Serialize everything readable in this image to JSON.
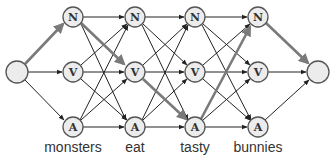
{
  "diagram": {
    "start_node": {
      "label": ""
    },
    "end_node": {
      "label": ""
    },
    "tags": [
      "N",
      "V",
      "A"
    ],
    "words": [
      "monsters",
      "eat",
      "tasty",
      "bunnies"
    ],
    "columns": [
      {
        "word": "monsters",
        "nodes": [
          "N",
          "V",
          "A"
        ]
      },
      {
        "word": "eat",
        "nodes": [
          "N",
          "V",
          "A"
        ]
      },
      {
        "word": "tasty",
        "nodes": [
          "N",
          "V",
          "A"
        ]
      },
      {
        "word": "bunnies",
        "nodes": [
          "N",
          "V",
          "A"
        ]
      }
    ],
    "highlighted_path": [
      "start",
      "N",
      "V",
      "A",
      "N",
      "end"
    ],
    "colors": {
      "node_fill": "#ececec",
      "node_stroke": "#555555",
      "edge": "#222222",
      "highlight_edge": "#7a7a7a"
    }
  },
  "labels": {
    "N1": "N",
    "V1": "V",
    "A1": "A",
    "N2": "N",
    "V2": "V",
    "A2": "A",
    "N3": "N",
    "V3": "V",
    "A3": "A",
    "N4": "N",
    "V4": "V",
    "A4": "A",
    "w1": "monsters",
    "w2": "eat",
    "w3": "tasty",
    "w4": "bunnies"
  }
}
